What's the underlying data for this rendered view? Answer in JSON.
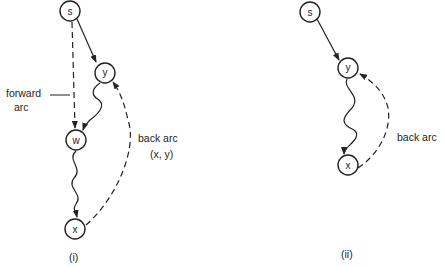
{
  "panels": [
    {
      "caption": "(i)",
      "nodes": [
        {
          "id": "s",
          "label": "s",
          "x": 70,
          "y": 11
        },
        {
          "id": "y",
          "label": "y",
          "x": 105,
          "y": 73
        },
        {
          "id": "w",
          "label": "w",
          "x": 76,
          "y": 140
        },
        {
          "id": "x",
          "label": "x",
          "x": 75,
          "y": 229
        }
      ],
      "edges": [
        {
          "from": "s",
          "to": "y",
          "style": "solid"
        },
        {
          "from": "s",
          "to": "w",
          "style": "dashed",
          "label": "forward arc"
        },
        {
          "from": "y",
          "to": "w",
          "style": "wavy"
        },
        {
          "from": "w",
          "to": "x",
          "style": "wavy"
        },
        {
          "from": "x",
          "to": "y",
          "style": "dashed",
          "label": "back arc (x, y)"
        }
      ],
      "labels": {
        "forward_1": "forward",
        "forward_2": "arc",
        "back_1": "back arc",
        "back_2": "(x, y)"
      }
    },
    {
      "caption": "(ii)",
      "nodes": [
        {
          "id": "s",
          "label": "s",
          "x": 310,
          "y": 12
        },
        {
          "id": "y",
          "label": "y",
          "x": 348,
          "y": 68
        },
        {
          "id": "x",
          "label": "x",
          "x": 348,
          "y": 165
        }
      ],
      "edges": [
        {
          "from": "s",
          "to": "y",
          "style": "solid"
        },
        {
          "from": "y",
          "to": "x",
          "style": "wavy"
        },
        {
          "from": "x",
          "to": "y",
          "style": "dashed",
          "label": "back arc"
        }
      ],
      "labels": {
        "back_1": "back arc"
      }
    }
  ]
}
